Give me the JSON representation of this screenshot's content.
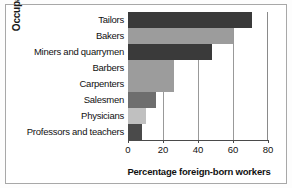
{
  "chart_data": {
    "type": "bar",
    "orientation": "horizontal",
    "title": "",
    "xlabel": "Percentage foreign-born workers",
    "ylabel": "Occupations",
    "categories": [
      "Tailors",
      "Bakers",
      "Miners and quarrymen",
      "Barbers",
      "Carpenters",
      "Salesmen",
      "Physicians",
      "Professors and teachers"
    ],
    "values": [
      71,
      60,
      48,
      26,
      26,
      16,
      10,
      8
    ],
    "xlim": [
      0,
      80
    ],
    "xticks": [
      0,
      20,
      40,
      60,
      80
    ],
    "xtick_labels": [
      "0",
      "20",
      "40",
      "60",
      "80"
    ],
    "grid": "vertical",
    "legend": "none",
    "bar_colors": [
      "#3a3a3a",
      "#9c9c9c",
      "#3a3a3a",
      "#9c9c9c",
      "#9c9c9c",
      "#6e6e6e",
      "#c0c0c0",
      "#4a4a4a"
    ]
  },
  "style": {
    "frame_border_color": "#a8a8a8",
    "gridline_color": "#999999",
    "axis_color": "#4a4a4a",
    "text_color": "#111111",
    "background": "#ffffff"
  }
}
